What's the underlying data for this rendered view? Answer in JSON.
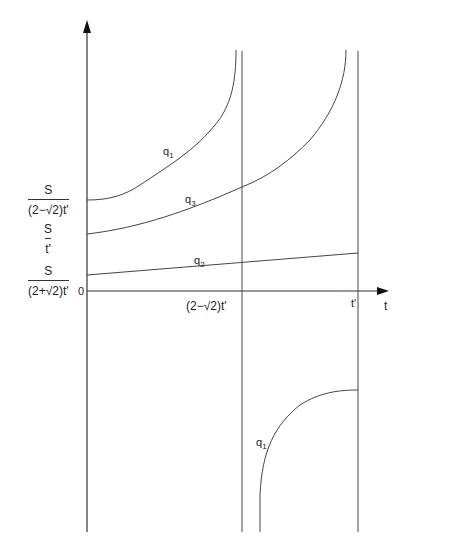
{
  "axes": {
    "x_label": "t",
    "origin_label": "0",
    "x_ticks": [
      {
        "label": "(2−√2)t'",
        "position": "vertical asymptote"
      },
      {
        "label": "t'",
        "position": "vertical asymptote"
      }
    ],
    "y_ticks": [
      {
        "num": "S",
        "den": "(2−√2)t'"
      },
      {
        "num": "S",
        "den": "t'"
      },
      {
        "num": "S",
        "den": "(2+√2)t'"
      }
    ]
  },
  "curves": [
    {
      "name": "q1",
      "label": "q",
      "sub": "1",
      "description": "upper branch rising from S/((2−√2)t') to +∞ at (2−√2)t'"
    },
    {
      "name": "q3",
      "label": "q",
      "sub": "3",
      "description": "rising from S/t' to +∞ near t'"
    },
    {
      "name": "q2",
      "label": "q",
      "sub": "2",
      "description": "nearly linear, rising from S/((2+√2)t')"
    },
    {
      "name": "q1-lower",
      "label": "q",
      "sub": "1",
      "description": "lower branch from −∞ after (2−√2)t' rising to t'"
    }
  ],
  "colors": {
    "line": "#444444",
    "background": "#ffffff"
  }
}
